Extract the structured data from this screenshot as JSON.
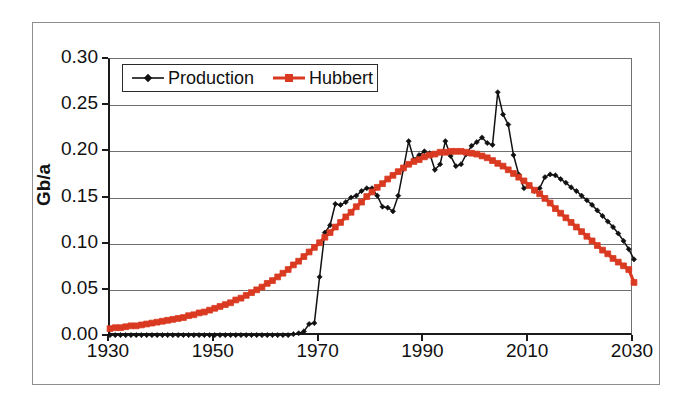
{
  "chart_data": {
    "type": "line",
    "title": "",
    "xlabel": "",
    "ylabel": "Gb/a",
    "xlim": [
      1930,
      2030
    ],
    "ylim": [
      0.0,
      0.3
    ],
    "grid": true,
    "legend_position": "top-left-inside",
    "x_ticks": [
      "1930",
      "1950",
      "1970",
      "1990",
      "2010",
      "2030"
    ],
    "x_tick_values": [
      1930,
      1950,
      1970,
      1990,
      2010,
      2030
    ],
    "y_ticks": [
      "0.00",
      "0.05",
      "0.10",
      "0.15",
      "0.20",
      "0.25",
      "0.30"
    ],
    "y_tick_values": [
      0.0,
      0.05,
      0.1,
      0.15,
      0.2,
      0.25,
      0.3
    ],
    "colors": {
      "production": "#111111",
      "hubbert": "#D93A21",
      "axis": "#1a1a1a",
      "grid": "#6f6f6f",
      "frame": "#8e8e8e",
      "background": "#ffffff"
    },
    "series": [
      {
        "name": "Production",
        "color": "#111111",
        "marker": "diamond",
        "x": [
          1930,
          1931,
          1932,
          1933,
          1934,
          1935,
          1936,
          1937,
          1938,
          1939,
          1940,
          1941,
          1942,
          1943,
          1944,
          1945,
          1946,
          1947,
          1948,
          1949,
          1950,
          1951,
          1952,
          1953,
          1954,
          1955,
          1956,
          1957,
          1958,
          1959,
          1960,
          1961,
          1962,
          1963,
          1964,
          1965,
          1966,
          1967,
          1968,
          1969,
          1970,
          1971,
          1972,
          1973,
          1974,
          1975,
          1976,
          1977,
          1978,
          1979,
          1980,
          1981,
          1982,
          1983,
          1984,
          1985,
          1986,
          1987,
          1988,
          1989,
          1990,
          1991,
          1992,
          1993,
          1994,
          1995,
          1996,
          1997,
          1998,
          1999,
          2000,
          2001,
          2002,
          2003,
          2004,
          2005,
          2006,
          2007,
          2008,
          2009,
          2010,
          2011,
          2012,
          2013,
          2014,
          2015,
          2016,
          2017,
          2018,
          2019,
          2020,
          2021,
          2022,
          2023,
          2024,
          2025,
          2026,
          2027,
          2028,
          2029,
          2030
        ],
        "y": [
          0.001,
          0.001,
          0.001,
          0.001,
          0.001,
          0.001,
          0.001,
          0.001,
          0.001,
          0.001,
          0.001,
          0.001,
          0.001,
          0.001,
          0.001,
          0.001,
          0.001,
          0.001,
          0.001,
          0.001,
          0.001,
          0.001,
          0.001,
          0.001,
          0.001,
          0.001,
          0.001,
          0.001,
          0.001,
          0.001,
          0.001,
          0.001,
          0.001,
          0.001,
          0.001,
          0.002,
          0.003,
          0.005,
          0.013,
          0.014,
          0.064,
          0.112,
          0.12,
          0.143,
          0.142,
          0.145,
          0.15,
          0.152,
          0.157,
          0.16,
          0.16,
          0.152,
          0.14,
          0.139,
          0.135,
          0.152,
          0.181,
          0.211,
          0.191,
          0.196,
          0.2,
          0.198,
          0.18,
          0.186,
          0.211,
          0.195,
          0.184,
          0.186,
          0.197,
          0.206,
          0.21,
          0.215,
          0.209,
          0.207,
          0.264,
          0.24,
          0.229,
          0.196,
          0.175,
          0.16,
          0.163,
          0.157,
          0.16,
          0.172,
          0.175,
          0.174,
          0.17,
          0.166,
          0.161,
          0.157,
          0.152,
          0.147,
          0.142,
          0.136,
          0.13,
          0.124,
          0.118,
          0.111,
          0.103,
          0.094,
          0.083
        ]
      },
      {
        "name": "Hubbert",
        "color": "#D93A21",
        "marker": "square",
        "x": [
          1930,
          1931,
          1932,
          1933,
          1934,
          1935,
          1936,
          1937,
          1938,
          1939,
          1940,
          1941,
          1942,
          1943,
          1944,
          1945,
          1946,
          1947,
          1948,
          1949,
          1950,
          1951,
          1952,
          1953,
          1954,
          1955,
          1956,
          1957,
          1958,
          1959,
          1960,
          1961,
          1962,
          1963,
          1964,
          1965,
          1966,
          1967,
          1968,
          1969,
          1970,
          1971,
          1972,
          1973,
          1974,
          1975,
          1976,
          1977,
          1978,
          1979,
          1980,
          1981,
          1982,
          1983,
          1984,
          1985,
          1986,
          1987,
          1988,
          1989,
          1990,
          1991,
          1992,
          1993,
          1994,
          1995,
          1996,
          1997,
          1998,
          1999,
          2000,
          2001,
          2002,
          2003,
          2004,
          2005,
          2006,
          2007,
          2008,
          2009,
          2010,
          2011,
          2012,
          2013,
          2014,
          2015,
          2016,
          2017,
          2018,
          2019,
          2020,
          2021,
          2022,
          2023,
          2024,
          2025,
          2026,
          2027,
          2028,
          2029,
          2030
        ],
        "y": [
          0.008,
          0.009,
          0.009,
          0.01,
          0.011,
          0.011,
          0.012,
          0.013,
          0.014,
          0.015,
          0.016,
          0.017,
          0.018,
          0.019,
          0.02,
          0.022,
          0.023,
          0.025,
          0.026,
          0.028,
          0.03,
          0.032,
          0.034,
          0.036,
          0.039,
          0.041,
          0.044,
          0.047,
          0.05,
          0.053,
          0.057,
          0.06,
          0.064,
          0.068,
          0.072,
          0.077,
          0.081,
          0.086,
          0.091,
          0.096,
          0.101,
          0.107,
          0.112,
          0.118,
          0.123,
          0.129,
          0.134,
          0.14,
          0.145,
          0.151,
          0.156,
          0.161,
          0.165,
          0.17,
          0.174,
          0.178,
          0.182,
          0.186,
          0.189,
          0.191,
          0.194,
          0.196,
          0.197,
          0.199,
          0.199,
          0.2,
          0.2,
          0.2,
          0.199,
          0.198,
          0.197,
          0.195,
          0.193,
          0.19,
          0.187,
          0.184,
          0.18,
          0.176,
          0.172,
          0.168,
          0.163,
          0.158,
          0.154,
          0.149,
          0.144,
          0.138,
          0.133,
          0.128,
          0.123,
          0.118,
          0.113,
          0.108,
          0.103,
          0.098,
          0.093,
          0.089,
          0.084,
          0.08,
          0.076,
          0.072,
          0.058
        ]
      }
    ]
  },
  "legend": {
    "entries": [
      {
        "label": "Production",
        "marker": "diamond",
        "color": "#111111"
      },
      {
        "label": "Hubbert",
        "marker": "square",
        "color": "#D93A21"
      }
    ]
  },
  "axes": {
    "y_label": "Gb/a"
  }
}
